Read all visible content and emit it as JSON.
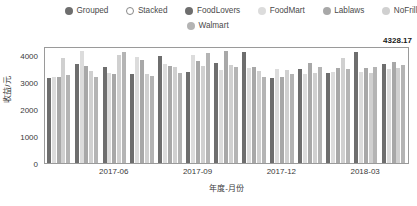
{
  "legend": {
    "mode_items": [
      {
        "label": "Grouped",
        "marker": "filled-circle-icon",
        "color": "#6e6e6e",
        "selected": true
      },
      {
        "label": "Stacked",
        "marker": "hollow-circle-icon",
        "color": "#ffffff",
        "selected": false
      }
    ],
    "series_items": [
      {
        "label": "FoodLovers",
        "marker": "filled-circle-icon",
        "color": "#6e6e6e"
      },
      {
        "label": "FoodMart",
        "marker": "filled-circle-icon",
        "color": "#dcdcdc"
      },
      {
        "label": "Lablaws",
        "marker": "filled-circle-icon",
        "color": "#a8a8a8"
      },
      {
        "label": "NoFrill",
        "marker": "filled-circle-icon",
        "color": "#d0d0d0"
      },
      {
        "label": "Walmart",
        "marker": "filled-circle-icon",
        "color": "#b4b4b4"
      }
    ]
  },
  "axes": {
    "y_max_label": "4328.17",
    "y_ticks": [
      "0",
      "1000",
      "2000",
      "3000",
      "4000"
    ],
    "y_tick_values": [
      0,
      1000,
      2000,
      3000,
      4000
    ],
    "y_title": "收益/元",
    "x_ticks": [
      "2017-06",
      "2017-09",
      "2017-12",
      "2018-03"
    ],
    "x_title": "年度-月份"
  },
  "chart_data": {
    "type": "bar",
    "title": "",
    "subtitle": "",
    "xlabel": "年度-月份",
    "ylabel": "收益/元",
    "ylim": [
      0,
      4328.17
    ],
    "grid": false,
    "legend_position": "top",
    "barmode": "grouped",
    "categories": [
      "2017-04",
      "2017-05",
      "2017-06",
      "2017-07",
      "2017-08",
      "2017-09",
      "2017-10",
      "2017-11",
      "2017-12",
      "2018-01",
      "2018-02",
      "2018-03",
      "2018-04"
    ],
    "x_tick_categories": [
      "2017-06",
      "2017-09",
      "2017-12",
      "2018-03"
    ],
    "series": [
      {
        "name": "FoodLovers",
        "color": "#6e6e6e",
        "values": [
          3150,
          3670,
          3560,
          3300,
          3950,
          3350,
          3700,
          4100,
          3150,
          3480,
          3340,
          4120,
          3650
        ]
      },
      {
        "name": "FoodMart",
        "color": "#dcdcdc",
        "values": [
          3180,
          4160,
          3320,
          3920,
          3680,
          3980,
          3450,
          3520,
          3480,
          3300,
          3360,
          3380,
          3460
        ]
      },
      {
        "name": "Lablaws",
        "color": "#a8a8a8",
        "values": [
          3170,
          3600,
          3280,
          3800,
          3600,
          3760,
          4150,
          3560,
          3180,
          3700,
          3520,
          3500,
          3720
        ]
      },
      {
        "name": "NoFrill",
        "color": "#d0d0d0",
        "values": [
          3880,
          3420,
          4000,
          3300,
          3560,
          3600,
          3620,
          3420,
          3440,
          3320,
          3900,
          3340,
          3520
        ]
      },
      {
        "name": "Walmart",
        "color": "#b4b4b4",
        "values": [
          3260,
          3200,
          4110,
          3210,
          3330,
          4080,
          3540,
          3180,
          3300,
          3560,
          3460,
          3560,
          3640
        ]
      }
    ]
  }
}
